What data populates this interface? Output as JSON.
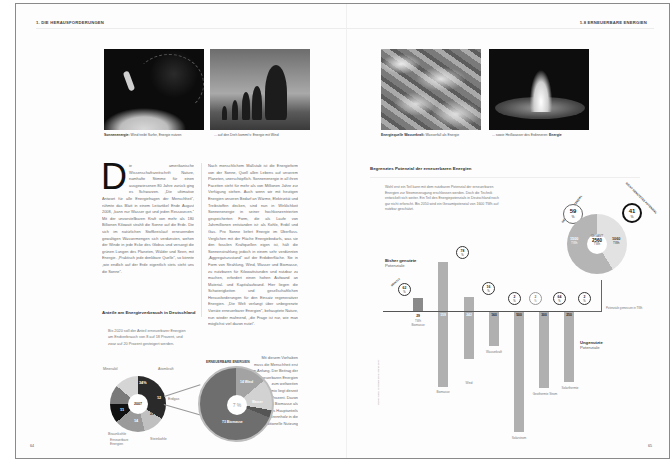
{
  "left_page": {
    "running_head": "1. DIE HERAUSFORDERUNGEN",
    "page_number": "64",
    "photos": [
      {
        "name": "surfer-photo",
        "caption_bold": "Sonnenenergie:",
        "caption": " Wind treibt Surfer, Energie nutzen"
      },
      {
        "name": "trees-photo",
        "caption_bold": "",
        "caption": "... auf den Dreh kommt's: Energie mit Wind"
      }
    ],
    "body": {
      "dropcap": "D",
      "col1": "ie amerikanische Wissenschaftszeitschrift Nature, namhafte Stimme für einen ausgewiesenen 80 Jahre zurück ging es Schwarzen. „Die ultimative Antwort für alle Energiefragen der Menschheit“, rühmte das Blatt in einem Leitartikel Ende August 2008, „kann nur Wasser gut und jeden Ressourcen.“ Mit der unvorstellbaren Kraft von mehr als 180 Billionen Kilowatt strahlt die Sonne auf die Erde. Die sich im natürlichen Stoffkreislauf erneuernden gewaltigen Wassermengen sich verdunsten, wehen der Winde in jede Ecke des Globus und versorgt die grünen Lungen des Planeten, Wälder und Seen, mit Energie. „Praktisch jede denkbare Quelle“, so könnte „wie endlich auf der Erde eigentlich stets steht uns die Sonne“.",
      "col2": "Nach menschlichem Maßstab ist die Energieform von der Sonne, Quell allen Lebens auf unserem Planeten, unerschöpflich. Sonnenenergie in all ihren Facetten steht für mehr als von Millionen Jahre zur Verfügung stehen. Auch wenn wir mit heutigen Energien unseren Bedarf an Wärme, Elektrizität und Treibstoffen decken, sind nun in Wirklichkeit Sonnenenergie in seiner hochkonzentrierten gespeicherten Form, die als Laufe von Jahrmillionen entstanden ist: als Kohle, Erdöl und Gas. Pro Sonne liefert Energie im Überfluss. Verglichen mit der Fläche Energiebedarfs, was sie den fossilen Kraftquellen eigen ist, hält die Sonnenstrahlung jedoch in einem sehr verdünnten „Aggregatszustand“ auf der Erdoberfläche. Sie in Form von Strahlung, Wind, Wasser und Biomasse, zu nutzbaren für Kilowattstunden und nutzbar zu machen, erfordert einen hohen Aufwand an Material- und Kapitalaufwand. Hier liegen die Schwierigkeiten und gesellschaftlichen Herausforderungen für den Einsatz regenerativer Energien. „Die Welt verlangt über unbegrenzte Vorräte erneuerbarer Energien“, behauptete Nature, nun wieder mahnend, „die Frage ist nur, wie man möglichst viel davon nutzt“.",
      "col3": "Mit diesem Vorhaben muss die Menschheit erst im Anfang. Der Beitrag der erneuerbaren Energien zum weltweiten Energiemix liegt derzeit bei 14 Prozent. Davon trägt die Biomasse als Lieferant des Hauptanteils an Brennholz in die traditionelle Nutzung"
    },
    "section": {
      "title": "Anteile am Energieverbrauch in Deutschland",
      "intro": "Bis 2020 soll der Anteil erneuerbarer Energien am Endverbrauch von 8 auf 18 Prozent, und zwar auf 20 Prozent gesteigert werden."
    },
    "small_donut": {
      "center": "2007",
      "segments": [
        {
          "label": "Mineralöl",
          "value": "34",
          "unit": "%",
          "color": "#2a2a2a"
        },
        {
          "label": "Atomkraft",
          "value": "12",
          "unit": "%",
          "color": "#c0c0c0"
        },
        {
          "label": "Erdgas",
          "value": "23",
          "unit": "%",
          "color": "#9a9a9a"
        },
        {
          "label": "Steinkohle",
          "value": "14",
          "unit": "%",
          "color": "#111111"
        },
        {
          "label": "Braunkohle",
          "value": "11",
          "unit": "%",
          "color": "#7a7a7a"
        },
        {
          "label": "Erneuerbare Energien",
          "value": "7",
          "unit": "%",
          "color": "#d5d5d5"
        }
      ],
      "callouts": [
        "Mineralöl",
        "Atomkraft",
        "Erdgas",
        "Erneuerbare Energien",
        "Mineralöl"
      ]
    },
    "big_donut": {
      "arc_title": "ERNEUERBARE ENERGIEN",
      "center": "7 %",
      "segments": [
        {
          "label": "Wind",
          "value": "14",
          "color": "#a3a3a3"
        },
        {
          "label": "Wasser",
          "value": "10",
          "color": "#d2d2d2"
        },
        {
          "label": "Sonstige",
          "value": "3",
          "color": "#555555"
        },
        {
          "label": "Biomasse",
          "value": "73",
          "color": "#6e6e6e"
        }
      ],
      "labels": {
        "top": "14 Wind",
        "bottom": "73 Biomasse",
        "right": "Wasser"
      }
    }
  },
  "right_page": {
    "running_head": "1.8 ERNEUERBARE ENERGIEN",
    "page_number": "65",
    "photos": [
      {
        "name": "waterfall-photo",
        "caption_bold": "Energiequelle Wasserkraft:",
        "caption": " Wasserfall als Energie"
      },
      {
        "name": "geyser-photo",
        "caption_bold": "Energie",
        "caption": "... sowie Heißwasser des Erdinneren: "
      }
    ],
    "chart_section": {
      "title": "Begrenztes Potenzial der erneuerbaren Energien",
      "intro": "Wohl erst ein Teil kann mit dem nutzbaren Potenzial der erneuerbaren Energien zur Stromerzeugung erschlossen werden. Doch die Technik entwickelt sich weiter. Ein Teil des Energiepotenzials in Deutschland noch gar nicht erforscht. Bis 2050 wird ein Gesamtpotenzial von 1600 TWh auf nutzbar geschätzt."
    },
    "legend": {
      "used_title": "Bisher genutzte",
      "used_sub": "Potenziale",
      "unused_title": "Ungenutzte",
      "unused_sub": "Potenziale"
    },
    "summary_pie": {
      "arc_left": "GENUTZTES POTENZIAL",
      "arc_right": "NICHT GENUTZTES POTENZIAL",
      "used_pct": "59",
      "used_unit": "%",
      "unused_pct": "41",
      "unused_unit": "%",
      "center_label": "GESAMT",
      "center_value": "2560",
      "center_unit": "TWh",
      "left_value": "1500",
      "left_unit": "TWh",
      "right_value": "1060",
      "right_unit": "TWh"
    },
    "note": "Potenziale gemessen in TWh",
    "credit": "Quelle: BMU, Leitstudie 2008; Stand: 2007",
    "bars": [
      {
        "name": "Biomasse",
        "used": "29",
        "used_unit": "TWh",
        "pct": "62",
        "above": 13,
        "below": 0
      },
      {
        "name": "Biomasse",
        "used": "159",
        "used_unit": "TWh",
        "pct": "78",
        "above": 64,
        "below": 70
      },
      {
        "name": "Wind",
        "used": "242",
        "used_unit": "TWh",
        "pct": "16",
        "above": 31,
        "below": 47
      },
      {
        "name": "Wasserkraft",
        "used": "160",
        "used_unit": "TWh",
        "pct": "2",
        "above": 0,
        "below": 34
      },
      {
        "name": "Solarstrom",
        "used": "500",
        "used_unit": "TWh",
        "pct": "2",
        "above": 0,
        "below": 118
      },
      {
        "name": "Geothermie Strom",
        "used": "300",
        "used_unit": "TWh",
        "pct": "64",
        "above": 0,
        "below": 72
      },
      {
        "name": "Solarthermie",
        "used": "250",
        "used_unit": "TWh",
        "pct": "2",
        "above": 0,
        "below": 66
      }
    ]
  }
}
